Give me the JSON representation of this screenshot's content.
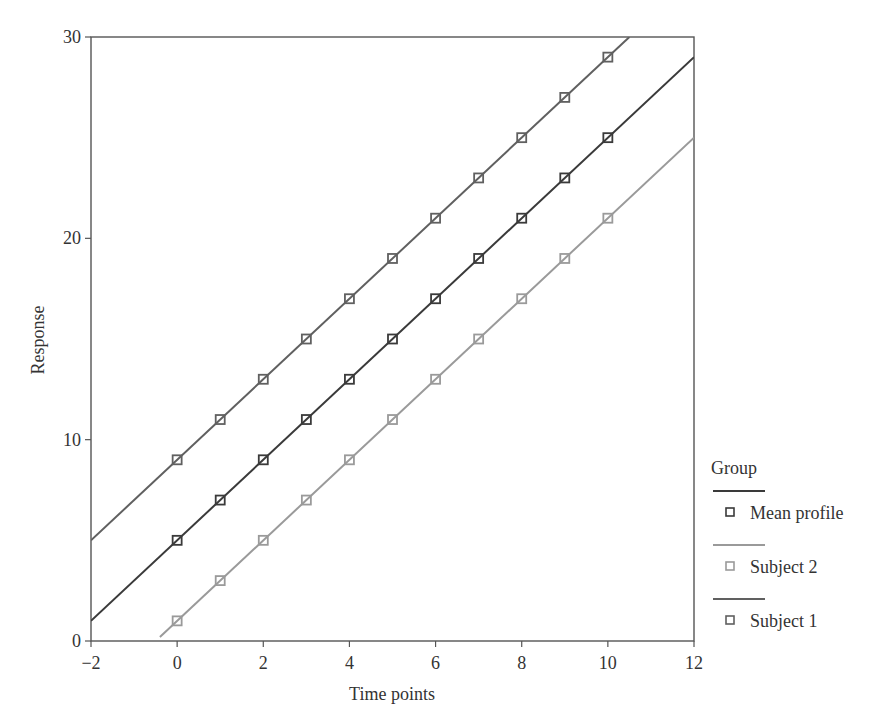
{
  "chart_data": {
    "type": "line",
    "title": "",
    "xlabel": "Time points",
    "ylabel": "Response",
    "xlim": [
      -2,
      12
    ],
    "ylim": [
      0,
      30
    ],
    "xticks": [
      -2,
      0,
      2,
      4,
      6,
      8,
      10,
      12
    ],
    "xtick_labels": [
      "−2",
      "0",
      "2",
      "4",
      "6",
      "8",
      "10",
      "12"
    ],
    "yticks": [
      0,
      10,
      20,
      30
    ],
    "ytick_labels": [
      "0",
      "10",
      "20",
      "30"
    ],
    "grid": false,
    "legend_position": "right",
    "legend_title": "Group",
    "x": [
      0,
      1,
      2,
      3,
      4,
      5,
      6,
      7,
      8,
      9,
      10
    ],
    "series": [
      {
        "name": "Mean profile",
        "color": "#3a3a3a",
        "line": {
          "intercept": 5,
          "slope": 2,
          "x_start": -2,
          "x_end": 12
        },
        "values": [
          5,
          7,
          9,
          11,
          13,
          15,
          17,
          19,
          21,
          23,
          25
        ]
      },
      {
        "name": "Subject 2",
        "color": "#9a9a9a",
        "line": {
          "intercept": 1,
          "slope": 2,
          "x_start": -0.4,
          "x_end": 12
        },
        "values": [
          1,
          3,
          5,
          7,
          9,
          11,
          13,
          15,
          17,
          19,
          21
        ]
      },
      {
        "name": "Subject 1",
        "color": "#606060",
        "line": {
          "intercept": 9,
          "slope": 2,
          "x_start": -2,
          "x_end": 10.5
        },
        "values": [
          9,
          11,
          13,
          15,
          17,
          19,
          21,
          23,
          25,
          27,
          29
        ]
      }
    ]
  }
}
